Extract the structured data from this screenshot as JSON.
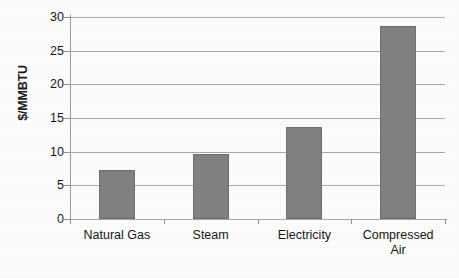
{
  "chart_data": {
    "type": "bar",
    "title": "",
    "xlabel": "",
    "ylabel": "$/MMBTU",
    "categories": [
      "Natural Gas",
      "Steam",
      "Electricity",
      "Compressed Air"
    ],
    "values": [
      7.3,
      9.7,
      13.6,
      28.6
    ],
    "ylim": [
      0,
      30
    ],
    "ytick_values": [
      0,
      5,
      10,
      15,
      20,
      25,
      30
    ],
    "ytick_labels": [
      "0",
      "5",
      "10",
      "15",
      "20",
      "25",
      "30"
    ],
    "grid": true,
    "legend": false,
    "legend_position": "none",
    "bar_color": "#808080",
    "bar_border_color": "#6d6d6d",
    "gridline_color": "#a8a8a8",
    "axis_color": "#8f8f8f",
    "background_color": "#fdfdfd",
    "text_color": "#161616",
    "category_labels": [
      {
        "line1": "Natural Gas",
        "line2": ""
      },
      {
        "line1": "Steam",
        "line2": ""
      },
      {
        "line1": "Electricity",
        "line2": ""
      },
      {
        "line1": "Compressed",
        "line2": "Air"
      }
    ]
  }
}
